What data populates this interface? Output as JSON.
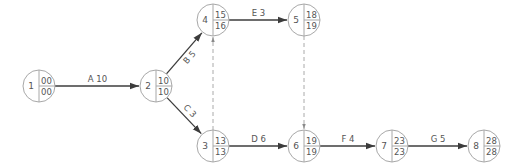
{
  "diagram": {
    "type": "activity-on-arrow network",
    "nodes": [
      {
        "id": "1",
        "x": 39,
        "y": 86,
        "early": "00",
        "late": "00"
      },
      {
        "id": "2",
        "x": 156,
        "y": 86,
        "early": "10",
        "late": "10"
      },
      {
        "id": "3",
        "x": 213,
        "y": 146,
        "early": "13",
        "late": "13"
      },
      {
        "id": "4",
        "x": 213,
        "y": 20,
        "early": "15",
        "late": "16"
      },
      {
        "id": "5",
        "x": 304,
        "y": 20,
        "early": "18",
        "late": "19"
      },
      {
        "id": "6",
        "x": 304,
        "y": 146,
        "early": "19",
        "late": "19"
      },
      {
        "id": "7",
        "x": 392,
        "y": 146,
        "early": "23",
        "late": "23"
      },
      {
        "id": "8",
        "x": 484,
        "y": 146,
        "early": "28",
        "late": "28"
      }
    ],
    "edges": [
      {
        "from": "1",
        "to": "2",
        "label": "A 10",
        "dashed": false
      },
      {
        "from": "2",
        "to": "4",
        "label": "B 5",
        "dashed": false
      },
      {
        "from": "2",
        "to": "3",
        "label": "C 3",
        "dashed": false
      },
      {
        "from": "3",
        "to": "6",
        "label": "D 6",
        "dashed": false
      },
      {
        "from": "4",
        "to": "5",
        "label": "E 3",
        "dashed": false
      },
      {
        "from": "6",
        "to": "7",
        "label": "F 4",
        "dashed": false
      },
      {
        "from": "7",
        "to": "8",
        "label": "G 5",
        "dashed": false
      },
      {
        "from": "3",
        "to": "4",
        "label": "",
        "dashed": true
      },
      {
        "from": "5",
        "to": "6",
        "label": "",
        "dashed": true
      }
    ],
    "colors": {
      "arrow": "#3c3c3c",
      "node_stroke": "#a8a8a8",
      "dummy": "#aaaaaa",
      "text": "#555555"
    }
  }
}
